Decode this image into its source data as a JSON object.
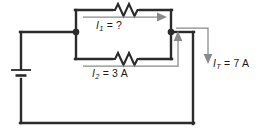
{
  "diagram": {
    "type": "electrical-schematic",
    "colors": {
      "wire": "#2b2b2b",
      "annotation": "#8a8a8a",
      "text": "#1b1b1b",
      "background": "#ffffff"
    },
    "labels": {
      "i1": {
        "symbol": "I",
        "subscript": "1",
        "equals": "=",
        "value": "?",
        "text": "I1 = ?"
      },
      "i2": {
        "symbol": "I",
        "subscript": "2",
        "equals": "=",
        "value": "3 A",
        "text": "I2 = 3 A"
      },
      "it": {
        "symbol": "I",
        "subscript": "T",
        "equals": "=",
        "value": "7 A",
        "text": "IT = 7 A"
      }
    },
    "components": [
      {
        "name": "battery",
        "type": "voltage-source",
        "position": "left"
      },
      {
        "name": "resistor-top",
        "type": "resistor",
        "branch": "I1"
      },
      {
        "name": "resistor-bottom",
        "type": "resistor",
        "branch": "I2"
      },
      {
        "name": "junction-left",
        "type": "node"
      },
      {
        "name": "junction-right",
        "type": "node"
      }
    ],
    "currents": [
      {
        "name": "I1",
        "value": null,
        "unit": "A",
        "known": false,
        "direction": "right"
      },
      {
        "name": "I2",
        "value": 3,
        "unit": "A",
        "known": true,
        "direction": "right"
      },
      {
        "name": "IT",
        "value": 7,
        "unit": "A",
        "known": true,
        "direction": "down"
      }
    ]
  }
}
